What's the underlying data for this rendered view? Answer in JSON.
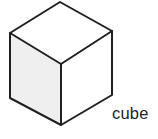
{
  "figure": {
    "name": "cube-diagram",
    "caption": "cube",
    "background_color": "#ffffff",
    "shape": {
      "name": "cube",
      "projection": "isometric",
      "outline_color": "#231f20",
      "outline_width_px": 2,
      "faces": [
        {
          "name": "top-face",
          "fill_color": "#ffffff",
          "points": "60,2 112,31 61,64 10,33"
        },
        {
          "name": "left-face",
          "fill_color": "#f0efef",
          "points": "10,33 61,64 61,125 10,98"
        },
        {
          "name": "right-face",
          "fill_color": "#ffffff",
          "points": "61,64 112,31 112,95 61,125"
        }
      ],
      "vertices": [
        {
          "name": "top-apex",
          "x": 60,
          "y": 2
        },
        {
          "name": "top-left",
          "x": 10,
          "y": 33
        },
        {
          "name": "top-right",
          "x": 112,
          "y": 31
        },
        {
          "name": "center-front",
          "x": 61,
          "y": 64
        },
        {
          "name": "bottom-left",
          "x": 10,
          "y": 98
        },
        {
          "name": "bottom-right",
          "x": 112,
          "y": 95
        },
        {
          "name": "bottom-front",
          "x": 61,
          "y": 125
        }
      ],
      "edges": [
        {
          "name": "edge-top-left-upper",
          "x1": 60,
          "y1": 2,
          "x2": 10,
          "y2": 33
        },
        {
          "name": "edge-top-right-upper",
          "x1": 60,
          "y1": 2,
          "x2": 112,
          "y2": 31
        },
        {
          "name": "edge-top-left-lower",
          "x1": 10,
          "y1": 33,
          "x2": 61,
          "y2": 64
        },
        {
          "name": "edge-top-right-lower",
          "x1": 112,
          "y1": 31,
          "x2": 61,
          "y2": 64
        },
        {
          "name": "edge-vertical-left",
          "x1": 10,
          "y1": 33,
          "x2": 10,
          "y2": 98
        },
        {
          "name": "edge-vertical-center",
          "x1": 61,
          "y1": 64,
          "x2": 61,
          "y2": 125
        },
        {
          "name": "edge-vertical-right",
          "x1": 112,
          "y1": 31,
          "x2": 112,
          "y2": 95
        },
        {
          "name": "edge-bottom-left",
          "x1": 10,
          "y1": 98,
          "x2": 61,
          "y2": 125
        },
        {
          "name": "edge-bottom-right",
          "x1": 112,
          "y1": 95,
          "x2": 61,
          "y2": 125
        }
      ]
    }
  }
}
